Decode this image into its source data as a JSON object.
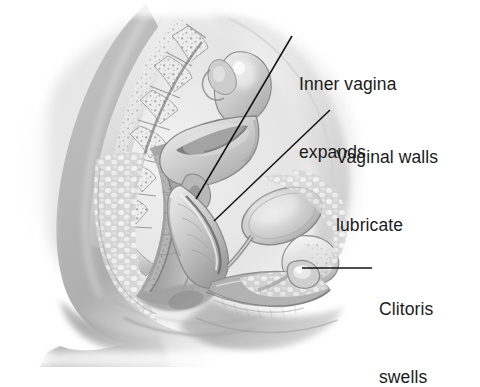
{
  "figure": {
    "kind": "medical-illustration",
    "view": "sagittal cross-section of female pelvis",
    "topic": "female sexual arousal response",
    "style": "grayscale pencil and airbrush rendering",
    "background_color": "#ffffff",
    "text_color": "#1b1b1b",
    "leader_line_color": "#131313"
  },
  "labels": [
    {
      "id": "inner-vagina",
      "line1": "Inner vagina",
      "line2": "expands",
      "x": 299,
      "y": 27,
      "leader": {
        "type": "diagonal",
        "x1": 292,
        "y1": 36,
        "x2": 196,
        "y2": 199
      }
    },
    {
      "id": "vaginal-walls",
      "line1": "Vaginal walls",
      "line2": "lubricate",
      "x": 336,
      "y": 100,
      "leader": {
        "type": "diagonal",
        "x1": 330,
        "y1": 110,
        "x2": 214,
        "y2": 221
      }
    },
    {
      "id": "clitoris",
      "line1": "Clitoris",
      "line2": "swells",
      "x": 379,
      "y": 252,
      "leader": {
        "type": "horizontal",
        "x1": 372,
        "y1": 268,
        "x2": 302,
        "y2": 268
      }
    }
  ],
  "anatomy": {
    "structures": [
      "sacrum and lumbar vertebrae",
      "uterus",
      "fallopian tube and ovary",
      "expanded vaginal canal",
      "urinary bladder",
      "pubic symphysis",
      "urethra",
      "rectum",
      "anus",
      "labia",
      "clitoris",
      "buttock and thigh contour"
    ]
  }
}
